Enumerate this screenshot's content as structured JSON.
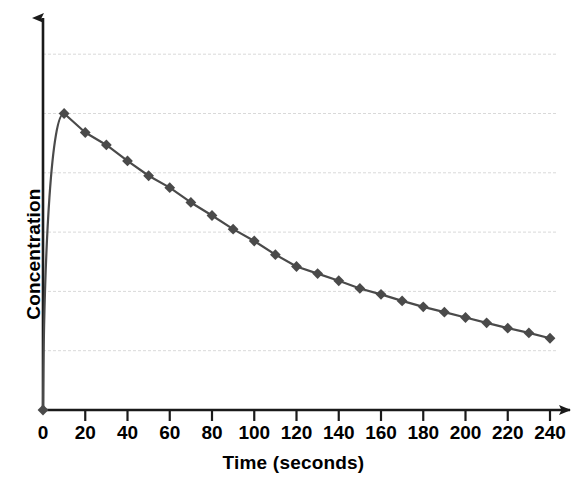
{
  "chart_data": {
    "type": "line",
    "title": "",
    "subtitle": "",
    "xlabel": "Time (seconds)",
    "ylabel": "Concentration",
    "xlim": [
      0,
      250
    ],
    "ylim": [
      0,
      6.0
    ],
    "grid": true,
    "grid_axis": "y",
    "legend": false,
    "legend_position": "none",
    "xticks": [
      0,
      20,
      40,
      60,
      80,
      100,
      120,
      140,
      160,
      180,
      200,
      220,
      240
    ],
    "xtick_labels": [
      "0",
      "20",
      "40",
      "60",
      "80",
      "100",
      "120",
      "140",
      "160",
      "180",
      "200",
      "220",
      "240"
    ],
    "yticks": [],
    "ytick_labels": [],
    "y_gridline_values": [
      1.0,
      2.0,
      3.0,
      4.0,
      5.0,
      6.0
    ],
    "marker": "diamond",
    "marker_color": "#4a4a4a",
    "line_color": "#4a4a4a",
    "axis_color": "#1a1a1a",
    "grid_color": "#d9d9d9",
    "background_color": "#ffffff",
    "x": [
      0,
      10,
      20,
      30,
      40,
      50,
      60,
      70,
      80,
      90,
      100,
      110,
      120,
      130,
      140,
      150,
      160,
      170,
      180,
      190,
      200,
      210,
      220,
      230,
      240
    ],
    "values": [
      0.0,
      5.0,
      4.68,
      4.47,
      4.2,
      3.95,
      3.75,
      3.5,
      3.28,
      3.05,
      2.85,
      2.62,
      2.42,
      2.3,
      2.18,
      2.05,
      1.95,
      1.84,
      1.74,
      1.65,
      1.56,
      1.47,
      1.38,
      1.3,
      1.21
    ],
    "annotations": []
  },
  "axis_titles": {
    "x": "Time (seconds)",
    "y": "Concentration"
  }
}
